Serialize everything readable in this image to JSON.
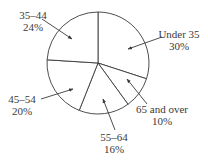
{
  "chart_data": {
    "type": "pie",
    "title": "",
    "start_angle_deg": 0,
    "direction": "clockwise",
    "categories": [
      "Under 35",
      "65 and over",
      "55–64",
      "45–54",
      "35–44"
    ],
    "values": [
      30,
      10,
      16,
      20,
      24
    ],
    "value_labels": [
      "30%",
      "10%",
      "16%",
      "20%",
      "24%"
    ],
    "legend": "none (callout labels with arrows)",
    "colors": {
      "fill": "#ffffff",
      "stroke": "#3a3a3a",
      "text": "#3a3a3a"
    }
  },
  "labels": {
    "under35": {
      "name": "Under 35",
      "pct": "30%"
    },
    "over65": {
      "name": "65 and over",
      "pct": "10%"
    },
    "age55_64": {
      "name": "55–64",
      "pct": "16%"
    },
    "age45_54": {
      "name": "45–54",
      "pct": "20%"
    },
    "age35_44": {
      "name": "35–44",
      "pct": "24%"
    }
  }
}
